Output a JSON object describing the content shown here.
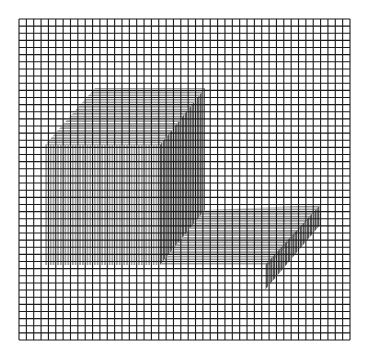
{
  "figure": {
    "grid": {
      "x0": 19,
      "y0": 19,
      "x1": 350,
      "y1": 340,
      "cells": 45,
      "line_color": "#1a1a1a"
    },
    "colors": {
      "background": "#ffffff",
      "light_bars": "#9a9a9a",
      "dark_bars": "#555555"
    },
    "regions": [
      {
        "name": "top-face",
        "orientation": "horizontal",
        "shade": "light",
        "points": [
          [
            45,
            145
          ],
          [
            160,
            145
          ],
          [
            205,
            88
          ],
          [
            95,
            88
          ]
        ]
      },
      {
        "name": "left-face",
        "orientation": "vertical",
        "shade": "light",
        "points": [
          [
            45,
            145
          ],
          [
            160,
            145
          ],
          [
            160,
            265
          ],
          [
            45,
            265
          ]
        ]
      },
      {
        "name": "right-face",
        "orientation": "vertical",
        "shade": "dark",
        "points": [
          [
            160,
            145
          ],
          [
            205,
            88
          ],
          [
            205,
            210
          ],
          [
            160,
            265
          ]
        ]
      },
      {
        "name": "l-shape-top",
        "orientation": "horizontal",
        "shade": "light",
        "points": [
          [
            160,
            265
          ],
          [
            205,
            210
          ],
          [
            320,
            205
          ],
          [
            270,
            265
          ]
        ]
      },
      {
        "name": "l-shape-side",
        "orientation": "vertical",
        "shade": "dark",
        "points": [
          [
            265,
            265
          ],
          [
            320,
            205
          ],
          [
            320,
            225
          ],
          [
            265,
            290
          ]
        ]
      }
    ]
  }
}
